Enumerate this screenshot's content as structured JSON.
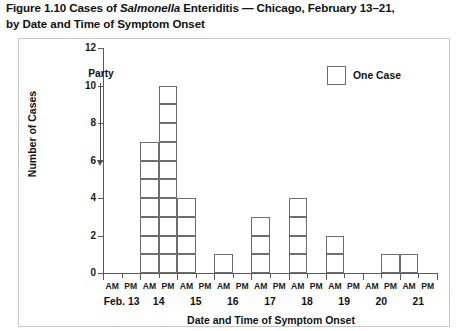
{
  "figure": {
    "number": "Figure 1.10",
    "title_part1": "Figure 1.10 Cases of ",
    "title_italic": "Salmonella",
    "title_part2": " Enteriditis — Chicago, February 13–21,",
    "title_line2": "by Date and Time of Symptom Onset"
  },
  "legend": {
    "swatch_name": "empty-square-swatch",
    "label": "One Case"
  },
  "annotation": {
    "label": "Party",
    "arrow": "down-arrow"
  },
  "chart_data": {
    "type": "bar",
    "title": "Figure 1.10 Cases of Salmonella Enteriditis — Chicago, February 13–21, by Date and Time of Symptom Onset",
    "subtitle": "",
    "xlabel": "Date and Time of Symptom Onset",
    "ylabel": "Number of Cases",
    "ylim": [
      0,
      12
    ],
    "yticks": [
      0,
      2,
      4,
      6,
      8,
      10,
      12
    ],
    "ytick_labels": [
      "0",
      "2",
      "4",
      "6",
      "8",
      "10",
      "12"
    ],
    "grid": false,
    "legend_position": "top-right",
    "legend_entries": [
      "One Case"
    ],
    "annotations": [
      {
        "text": "Party",
        "points_to": "Feb. 13 PM / Feb. 14 AM",
        "style": "down-arrow"
      }
    ],
    "day_labels": [
      "Feb. 13",
      "14",
      "15",
      "16",
      "17",
      "18",
      "19",
      "20",
      "21"
    ],
    "time_labels": [
      "AM",
      "PM"
    ],
    "categories": [
      "Feb. 13 AM",
      "Feb. 13 PM",
      "14 AM",
      "14 PM",
      "15 AM",
      "15 PM",
      "16 AM",
      "16 PM",
      "17 AM",
      "17 PM",
      "18 AM",
      "18 PM",
      "19 AM",
      "19 PM",
      "20 AM",
      "20 PM",
      "21 AM",
      "21 PM"
    ],
    "values": [
      0,
      0,
      7,
      10,
      4,
      0,
      1,
      0,
      3,
      0,
      4,
      0,
      2,
      0,
      0,
      1,
      1,
      0
    ],
    "total_cases": 33,
    "unit": "one stacked square = one case"
  }
}
